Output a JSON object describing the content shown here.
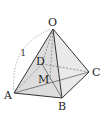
{
  "diagram": {
    "type": "square-pyramid",
    "colors": {
      "edge": "#333333",
      "hidden": "#777777",
      "face_light": "#e6e6e6",
      "face_dark": "#cfcfcf",
      "arc": "#999999"
    },
    "labels": {
      "O": "O",
      "A": "A",
      "B": "B",
      "C": "C",
      "D": "D",
      "M": "M",
      "edge_length": "1"
    }
  }
}
